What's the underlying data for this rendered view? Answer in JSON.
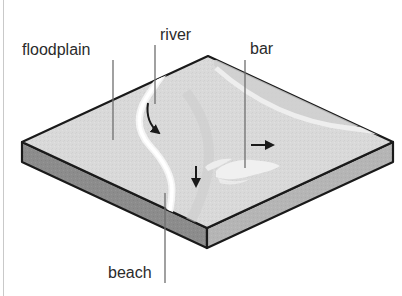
{
  "figure": {
    "background_color": "#ffffff",
    "frame_line_color": "#c9c9c9",
    "width": 402,
    "height": 296
  },
  "block": {
    "top_surface_color": "#d9d9d9",
    "side_face_left_color": "#8c8c8c",
    "side_face_right_color": "#b5b5b5",
    "outline_color": "#1a1a1a",
    "corners": {
      "left": [
        22,
        142
      ],
      "top": [
        208,
        56
      ],
      "right": [
        393,
        142
      ],
      "front": [
        207,
        228
      ]
    },
    "thickness": 20
  },
  "features": {
    "river": {
      "name": "river",
      "color": "#f2f2f2",
      "description": "meandering light channel curving from upper terrain down to the front-left edge"
    },
    "bar": {
      "name": "bar",
      "color": "#f0f0f0",
      "description": "elongated lens-shaped sand bar on the lower right of the plain"
    },
    "terrace": {
      "name": "terrace-shading",
      "color": "#cdcdcd",
      "description": "subtle darker band sweeping across the right side of the plain"
    }
  },
  "labels": [
    {
      "id": "floodplain",
      "text": "floodplain",
      "text_x": 22,
      "text_y": 55,
      "anchor": "start",
      "leader": {
        "x1": 113,
        "y1": 60,
        "x2": 113,
        "y2": 140
      },
      "leader_color": "#6e6e6e"
    },
    {
      "id": "river",
      "text": "river",
      "text_x": 160,
      "text_y": 40,
      "anchor": "start",
      "leader": {
        "x1": 155,
        "y1": 45,
        "x2": 155,
        "y2": 104
      },
      "leader_color": "#6e6e6e"
    },
    {
      "id": "bar",
      "text": "bar",
      "text_x": 250,
      "text_y": 54,
      "anchor": "start",
      "leader": {
        "x1": 245,
        "y1": 60,
        "x2": 245,
        "y2": 168
      },
      "leader_color": "#6e6e6e"
    },
    {
      "id": "beach",
      "text": "beach",
      "text_x": 108,
      "text_y": 278,
      "anchor": "start",
      "leader": {
        "x1": 165,
        "y1": 193,
        "x2": 165,
        "y2": 283
      },
      "leader_color": "#6e6e6e"
    }
  ],
  "flow_arrows": [
    {
      "id": "river-flow-arrow-curved",
      "kind": "curved",
      "direction": "down-right",
      "color": "#1a1a1a",
      "path": "M 148,103 C 146,116 150,126 159,133"
    },
    {
      "id": "river-flow-arrow-down",
      "kind": "straight",
      "direction": "down",
      "color": "#1a1a1a",
      "path": "M 196,166 L 196,188"
    },
    {
      "id": "bar-flow-arrow-right",
      "kind": "straight",
      "direction": "right",
      "color": "#1a1a1a",
      "path": "M 251,145 L 275,145"
    }
  ]
}
